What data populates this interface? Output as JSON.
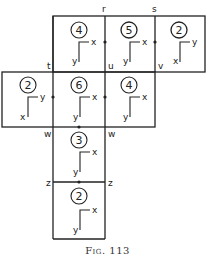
{
  "figure": {
    "caption": "Fig. 113",
    "edge_labels": {
      "r": "r",
      "s": "s",
      "t": "t",
      "u": "u",
      "v": "v",
      "w_left": "w",
      "w_right": "w",
      "z_left": "z",
      "z_right": "z"
    },
    "faces": [
      {
        "id": "top-left",
        "number": "4",
        "axis_h": "x",
        "axis_v": "y"
      },
      {
        "id": "top-mid",
        "number": "5",
        "axis_h": "x",
        "axis_v": "y"
      },
      {
        "id": "top-right",
        "number": "2",
        "axis_h": "y",
        "axis_v": "x"
      },
      {
        "id": "mid-left",
        "number": "2",
        "axis_h": "y",
        "axis_v": "x"
      },
      {
        "id": "mid-center",
        "number": "6",
        "axis_h": "x",
        "axis_v": "y"
      },
      {
        "id": "mid-right",
        "number": "4",
        "axis_h": "x",
        "axis_v": "y"
      },
      {
        "id": "lower",
        "number": "3",
        "axis_h": "x",
        "axis_v": "y"
      },
      {
        "id": "bottom",
        "number": "2",
        "axis_h": "x",
        "axis_v": "y"
      }
    ]
  }
}
